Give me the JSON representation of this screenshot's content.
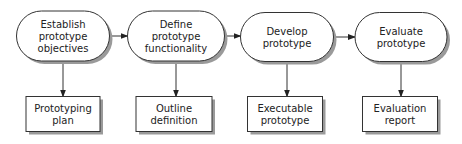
{
  "diagram": {
    "type": "flowchart",
    "colors": {
      "stroke": "#333333",
      "fill": "#ffffff",
      "shadow": "#9a9a9a",
      "text": "#222222"
    },
    "processes": [
      {
        "id": "p1",
        "lines": [
          "Establish",
          "prototype",
          "objectives"
        ],
        "cx": 63,
        "cy": 36,
        "w": 93,
        "h": 50
      },
      {
        "id": "p2",
        "lines": [
          "Define",
          "prototype",
          "functionality"
        ],
        "cx": 176,
        "cy": 36,
        "w": 97,
        "h": 50
      },
      {
        "id": "p3",
        "lines": [
          "Develop",
          "prototype"
        ],
        "cx": 287,
        "cy": 37,
        "w": 93,
        "h": 49
      },
      {
        "id": "p4",
        "lines": [
          "Evaluate",
          "prototype"
        ],
        "cx": 401,
        "cy": 37,
        "w": 92,
        "h": 49
      }
    ],
    "outputs": [
      {
        "id": "o1",
        "lines": [
          "Prototyping",
          "plan"
        ],
        "cx": 63,
        "cy": 114,
        "w": 74,
        "h": 35
      },
      {
        "id": "o2",
        "lines": [
          "Outline",
          "definition"
        ],
        "cx": 174,
        "cy": 114,
        "w": 76,
        "h": 35
      },
      {
        "id": "o3",
        "lines": [
          "Executable",
          "prototype"
        ],
        "cx": 285,
        "cy": 114,
        "w": 75,
        "h": 35
      },
      {
        "id": "o4",
        "lines": [
          "Evaluation",
          "report"
        ],
        "cx": 400,
        "cy": 114,
        "w": 75,
        "h": 35
      }
    ],
    "edges": [
      {
        "from": "p1",
        "to": "p2",
        "kind": "horizontal"
      },
      {
        "from": "p2",
        "to": "p3",
        "kind": "horizontal"
      },
      {
        "from": "p3",
        "to": "p4",
        "kind": "horizontal"
      },
      {
        "from": "p1",
        "to": "o1",
        "kind": "vertical"
      },
      {
        "from": "p2",
        "to": "o2",
        "kind": "vertical"
      },
      {
        "from": "p3",
        "to": "o3",
        "kind": "vertical"
      },
      {
        "from": "p4",
        "to": "o4",
        "kind": "vertical"
      }
    ]
  }
}
